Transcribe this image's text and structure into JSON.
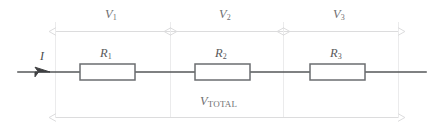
{
  "figure": {
    "colors": {
      "wire": "#555759",
      "resistor_outline": "#6b6d70",
      "dimension_line": "#dcdcdd",
      "guide_line": "#ebebec",
      "label_text": "#6f7072"
    }
  },
  "current": {
    "symbol": "I",
    "direction": "right"
  },
  "resistors": [
    {
      "symbol": "R",
      "subscript": "1"
    },
    {
      "symbol": "R",
      "subscript": "2"
    },
    {
      "symbol": "R",
      "subscript": "3"
    }
  ],
  "voltage_drops": [
    {
      "symbol": "V",
      "subscript": "1"
    },
    {
      "symbol": "V",
      "subscript": "2"
    },
    {
      "symbol": "V",
      "subscript": "3"
    }
  ],
  "total_voltage": {
    "symbol": "V",
    "subscript": "TOTAL"
  }
}
